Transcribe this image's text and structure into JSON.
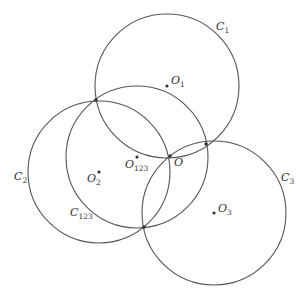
{
  "diagram": {
    "title": "",
    "circles": [
      {
        "id": "C1",
        "label": "C",
        "sub": "1",
        "cx": 167,
        "cy": 86,
        "r": 72,
        "label_x": 216,
        "label_y": 30
      },
      {
        "id": "C2",
        "label": "C",
        "sub": "2",
        "cx": 99,
        "cy": 172,
        "r": 71,
        "label_x": 14,
        "label_y": 180
      },
      {
        "id": "C123",
        "label": "C",
        "sub": "123",
        "cx": 137,
        "cy": 157,
        "r": 71,
        "label_x": 70,
        "label_y": 216
      },
      {
        "id": "C3",
        "label": "C",
        "sub": "3",
        "cx": 214,
        "cy": 213,
        "r": 72,
        "label_x": 281,
        "label_y": 181
      }
    ],
    "centers": [
      {
        "id": "O1",
        "label": "O",
        "sub": "1",
        "x": 167,
        "y": 86,
        "label_x": 171,
        "label_y": 84
      },
      {
        "id": "O2",
        "label": "O",
        "sub": "2",
        "x": 99,
        "y": 172,
        "label_x": 87,
        "label_y": 182
      },
      {
        "id": "O123",
        "label": "O",
        "sub": "123",
        "x": 137,
        "y": 157,
        "label_x": 125,
        "label_y": 168
      },
      {
        "id": "O3",
        "label": "O",
        "sub": "3",
        "x": 214,
        "y": 213,
        "label_x": 218,
        "label_y": 212
      }
    ],
    "points": [
      {
        "id": "O",
        "label": "O",
        "x": 170,
        "y": 156,
        "label_x": 174,
        "label_y": 166
      },
      {
        "id": "P12",
        "label": "",
        "x": 96,
        "y": 100
      },
      {
        "id": "P13",
        "label": "",
        "x": 206,
        "y": 144
      },
      {
        "id": "P23",
        "label": "",
        "x": 144,
        "y": 227
      }
    ]
  }
}
